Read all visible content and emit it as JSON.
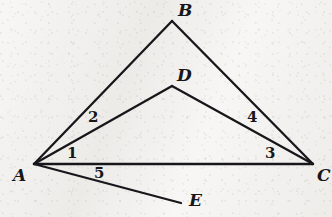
{
  "figure": {
    "width": 332,
    "height": 217,
    "background_color": "#f1f0ee",
    "ink_color": "#17161a"
  },
  "points": [
    {
      "id": "A",
      "label": "A",
      "x": 34,
      "y": 164,
      "label_x": 13,
      "label_y": 167
    },
    {
      "id": "B",
      "label": "B",
      "x": 172,
      "y": 21,
      "label_x": 178,
      "label_y": 2
    },
    {
      "id": "C",
      "label": "C",
      "x": 313,
      "y": 164,
      "label_x": 317,
      "label_y": 167
    },
    {
      "id": "D",
      "label": "D",
      "x": 172,
      "y": 86,
      "label_x": 177,
      "label_y": 67
    },
    {
      "id": "E",
      "label": "E",
      "x": 181,
      "y": 203,
      "label_x": 189,
      "label_y": 192
    }
  ],
  "segments": [
    {
      "id": "AB",
      "from": "A",
      "to": "B",
      "x1": 34,
      "y1": 164,
      "x2": 172,
      "y2": 21,
      "width": 2.3
    },
    {
      "id": "BC",
      "from": "B",
      "to": "C",
      "x1": 172,
      "y1": 21,
      "x2": 313,
      "y2": 164,
      "width": 2.3
    },
    {
      "id": "AD",
      "from": "A",
      "to": "D",
      "x1": 34,
      "y1": 164,
      "x2": 172,
      "y2": 86,
      "width": 2.3
    },
    {
      "id": "DC",
      "from": "D",
      "to": "C",
      "x1": 172,
      "y1": 86,
      "x2": 313,
      "y2": 164,
      "width": 2.3
    },
    {
      "id": "AC",
      "from": "A",
      "to": "C",
      "x1": 34,
      "y1": 164,
      "x2": 313,
      "y2": 164,
      "width": 2.3
    },
    {
      "id": "AE",
      "from": "A",
      "to": "E",
      "x1": 34,
      "y1": 164,
      "x2": 181,
      "y2": 203,
      "width": 2.3
    }
  ],
  "angle_labels": [
    {
      "id": "angle-1",
      "label": "1",
      "x": 67,
      "y": 146,
      "at_vertex": "A"
    },
    {
      "id": "angle-2",
      "label": "2",
      "x": 88,
      "y": 110,
      "at_vertex": "A"
    },
    {
      "id": "angle-3",
      "label": "3",
      "x": 265,
      "y": 146,
      "at_vertex": "C"
    },
    {
      "id": "angle-4",
      "label": "4",
      "x": 247,
      "y": 110,
      "at_vertex": "C"
    },
    {
      "id": "angle-5",
      "label": "5",
      "x": 94,
      "y": 166,
      "at_vertex": "A"
    }
  ]
}
